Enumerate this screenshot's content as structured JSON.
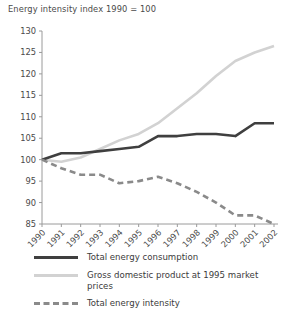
{
  "chart_data": {
    "type": "line",
    "title": "Energy intensity index 1990 = 100",
    "xlabel": "",
    "ylabel": "",
    "ylim": [
      85,
      130
    ],
    "ytick_step": 5,
    "yticks": [
      85,
      90,
      95,
      100,
      105,
      110,
      115,
      120,
      125,
      130
    ],
    "grid": false,
    "legend_position": "bottom-left",
    "categories": [
      "1990",
      "1991",
      "1992",
      "1993",
      "1994",
      "1995",
      "1996",
      "1997",
      "1998",
      "1999",
      "2000",
      "2001",
      "2002"
    ],
    "series": [
      {
        "name": "Total energy consumption",
        "color": "#3f3f3f",
        "style": "solid",
        "width": 2.6,
        "values": [
          100,
          101.5,
          101.5,
          102,
          102.5,
          103,
          105.5,
          105.5,
          106,
          106,
          105.5,
          108.5,
          108.5
        ]
      },
      {
        "name": "Gross domestic product at 1995 market prices",
        "color": "#d2d2d2",
        "style": "solid",
        "width": 2.6,
        "values": [
          100,
          99.5,
          100.5,
          102.5,
          104.5,
          106,
          108.5,
          112,
          115.5,
          119.5,
          123,
          125,
          126.5
        ]
      },
      {
        "name": "Total energy intensity",
        "color": "#8a8a8a",
        "style": "dashed",
        "width": 2.6,
        "values": [
          100,
          98,
          96.5,
          96.5,
          94.5,
          95,
          96,
          94.5,
          92.5,
          90,
          87,
          87,
          85
        ]
      }
    ]
  },
  "legend": {
    "items": [
      {
        "label": "Total energy consumption",
        "swatch": "sw-solid-dark"
      },
      {
        "label": "Gross domestic product at 1995 market prices",
        "swatch": "sw-solid-light"
      },
      {
        "label": "Total energy intensity",
        "swatch": "sw-dashed"
      }
    ]
  },
  "axis_colors": {
    "axis_line": "#9a9a9a",
    "tick": "#9a9a9a",
    "text": "#4a4a4a"
  }
}
